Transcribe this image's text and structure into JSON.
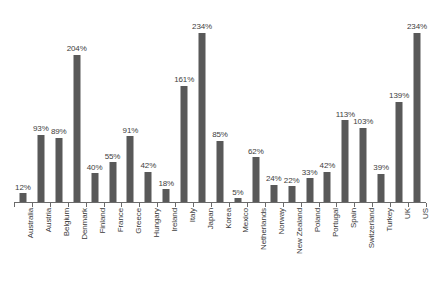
{
  "chart_data": {
    "type": "bar",
    "title": "",
    "xlabel": "",
    "ylabel": "",
    "ylim": [
      0,
      260
    ],
    "grid": false,
    "legend": "none",
    "unit": "%",
    "categories": [
      "Australia",
      "Austria",
      "Belgium",
      "Denmark",
      "Finland",
      "France",
      "Greece",
      "Hungary",
      "Ireland",
      "Italy",
      "Japan",
      "Korea",
      "Mexico",
      "Netherlands",
      "Norway",
      "New Zealand",
      "Poland",
      "Portugal",
      "Spain",
      "Switzerland",
      "Turkey",
      "UK",
      "US"
    ],
    "values": [
      12,
      93,
      89,
      204,
      40,
      55,
      91,
      42,
      18,
      161,
      234,
      85,
      5,
      62,
      24,
      22,
      33,
      42,
      113,
      103,
      39,
      139,
      234
    ],
    "labels": [
      "12%",
      "93%",
      "89%",
      "204%",
      "40%",
      "55%",
      "91%",
      "42%",
      "18%",
      "161%",
      "234%",
      "85%",
      "5%",
      "62%",
      "24%",
      "22%",
      "33%",
      "42%",
      "113%",
      "103%",
      "39%",
      "139%",
      "234%"
    ],
    "bar_color": "#595959",
    "axis_color": "#6b6b6b",
    "label_color": "#404040",
    "background": "#ffffff"
  },
  "artifacts": {
    "title_sliver": "",
    "footer_left": "",
    "footer_right": ""
  }
}
